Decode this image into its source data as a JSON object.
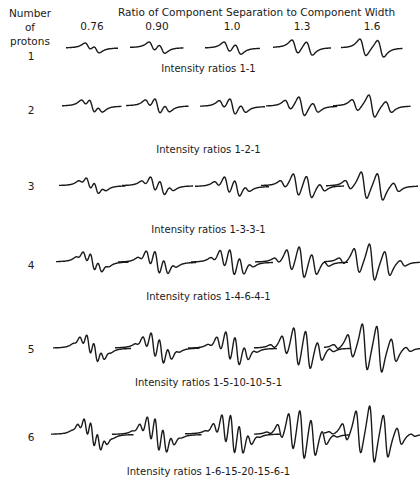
{
  "header": {
    "row_axis_label_line1": "Number",
    "row_axis_label_line2": "of protons",
    "column_axis_title": "Ratio of Component Separation to Component Width"
  },
  "columns": [
    {
      "label": "0.76",
      "ratio": 0.76,
      "x": 92
    },
    {
      "label": "0.90",
      "ratio": 0.9,
      "x": 157
    },
    {
      "label": "1.0",
      "ratio": 1.0,
      "x": 232
    },
    {
      "label": "1.3",
      "ratio": 1.3,
      "x": 302
    },
    {
      "label": "1.6",
      "ratio": 1.6,
      "x": 372
    }
  ],
  "rows": [
    {
      "protons": "1",
      "label_y": 56,
      "wave_y": 48,
      "caption": "Intensity ratios 1-1",
      "caption_y": 69,
      "intensities": [
        1,
        1
      ],
      "amp": 9
    },
    {
      "protons": "2",
      "label_y": 110,
      "wave_y": 106,
      "caption": "Intensity ratios 1-2-1",
      "caption_y": 150,
      "intensities": [
        1,
        2,
        1
      ],
      "amp": 11
    },
    {
      "protons": "3",
      "label_y": 186,
      "wave_y": 186,
      "caption": "Intensity ratios 1-3-3-1",
      "caption_y": 230,
      "intensities": [
        1,
        3,
        3,
        1
      ],
      "amp": 14
    },
    {
      "protons": "4",
      "label_y": 265,
      "wave_y": 262,
      "caption": "Intensity ratios 1-4-6-4-1",
      "caption_y": 297,
      "intensities": [
        1,
        4,
        6,
        4,
        1
      ],
      "amp": 18
    },
    {
      "protons": "5",
      "label_y": 349,
      "wave_y": 348,
      "caption": "Intensity ratios 1-5-10-10-5-1",
      "caption_y": 383,
      "intensities": [
        1,
        5,
        10,
        10,
        5,
        1
      ],
      "amp": 24
    },
    {
      "protons": "6",
      "label_y": 437,
      "wave_y": 434,
      "caption": "Intensity ratios 1-6-15-20-15-6-1",
      "caption_y": 472,
      "intensities": [
        1,
        6,
        15,
        20,
        15,
        6,
        1
      ],
      "amp": 28
    }
  ],
  "colors": {
    "ink": "#1a1a1a",
    "background": "#ffffff"
  }
}
